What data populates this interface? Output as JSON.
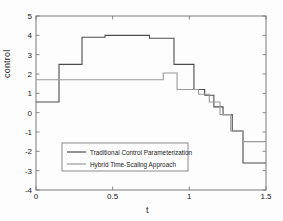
{
  "chart_data": {
    "type": "line",
    "title": "",
    "xlabel": "t",
    "ylabel": "control",
    "xlim": [
      0,
      1.5
    ],
    "ylim": [
      -4,
      5
    ],
    "xticks": [
      0,
      0.5,
      1,
      1.5
    ],
    "xticklabels": [
      "0",
      "0.5",
      "1",
      "1.5"
    ],
    "yticks": [
      -4,
      -3,
      -2,
      -1,
      0,
      1,
      2,
      3,
      4,
      5
    ],
    "yticklabels": [
      "-4",
      "-3",
      "-2",
      "-1",
      "0",
      "1",
      "2",
      "3",
      "4",
      "5"
    ],
    "grid": false,
    "legend_position": "lower left",
    "drawstyle": "steps-post",
    "series": [
      {
        "name": "Traditional Control Parameterization",
        "color": "#4d4d4d",
        "x": [
          0.0,
          0.15,
          0.3,
          0.45,
          0.74,
          0.9,
          1.03,
          1.1,
          1.16,
          1.22,
          1.28,
          1.35,
          1.5
        ],
        "values": [
          0.55,
          2.5,
          3.9,
          4.0,
          3.85,
          2.5,
          1.2,
          0.9,
          0.3,
          -0.1,
          -0.95,
          -2.6,
          -2.6
        ]
      },
      {
        "name": "Hybrid Time-Scaling Approach",
        "color": "#9a9a9a",
        "x": [
          0.0,
          0.83,
          0.92,
          1.06,
          1.13,
          1.2,
          1.27,
          1.35,
          1.5
        ],
        "values": [
          1.7,
          2.05,
          1.2,
          0.95,
          0.55,
          -0.1,
          -0.95,
          -1.5,
          -1.5
        ]
      }
    ]
  },
  "legend": {
    "entries": [
      {
        "label": "Traditional Control Parameterization",
        "color": "#4d4d4d"
      },
      {
        "label": "Hybrid Time-Scaling Approach",
        "color": "#9a9a9a"
      }
    ]
  },
  "axes": {
    "x_title": "t",
    "y_title": "control"
  }
}
